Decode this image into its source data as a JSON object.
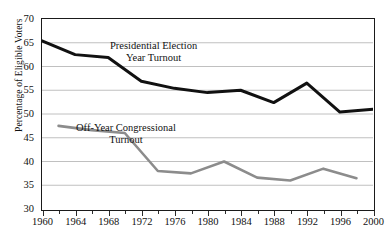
{
  "figure": {
    "ytitle": "Percentage of Eligible Voters",
    "annotations": [
      {
        "name": "presidential",
        "line1": "Presidential Election",
        "line2": "Year Turnout"
      },
      {
        "name": "offyear",
        "line1": "Off-Year Congressional",
        "line2": "Turnout"
      }
    ],
    "colors": {
      "presidential": "#111111",
      "offyear": "#8c8c8c",
      "grid": "#b9b9b9",
      "frame": "#1a1a1a"
    }
  },
  "chart_data": {
    "type": "line",
    "title": "",
    "xlabel": "",
    "ylabel": "Percentage of Eligible Voters",
    "xlim": [
      1960,
      2000
    ],
    "ylim": [
      30,
      70
    ],
    "yticks": [
      30,
      35,
      40,
      45,
      50,
      55,
      60,
      65,
      70
    ],
    "xticks": [
      1960,
      1964,
      1968,
      1972,
      1976,
      1980,
      1984,
      1988,
      1992,
      1996,
      2000
    ],
    "xminorticks": [
      1962,
      1966,
      1970,
      1974,
      1978,
      1982,
      1986,
      1990,
      1994,
      1998
    ],
    "grid": "horizontal",
    "legend": "inline-annotations",
    "series": [
      {
        "name": "Presidential Election Year Turnout",
        "color": "#111111",
        "x": [
          1960,
          1964,
          1968,
          1972,
          1976,
          1980,
          1984,
          1988,
          1992,
          1996,
          2000
        ],
        "values": [
          65.4,
          62.5,
          61.9,
          56.9,
          55.4,
          54.5,
          55.0,
          52.4,
          56.5,
          50.4,
          51.0
        ]
      },
      {
        "name": "Off-Year Congressional Turnout",
        "color": "#8c8c8c",
        "x": [
          1962,
          1966,
          1970,
          1974,
          1978,
          1982,
          1986,
          1990,
          1994,
          1998
        ],
        "values": [
          47.5,
          46.6,
          46.0,
          38.0,
          37.5,
          40.0,
          36.6,
          36.0,
          38.5,
          36.5
        ]
      }
    ]
  }
}
